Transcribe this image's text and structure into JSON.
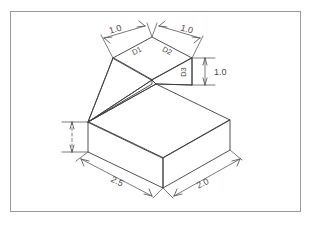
{
  "figure": {
    "frame": {
      "stroke_color": "#9a9a9a",
      "fill_color": "#ffffff",
      "x": 10,
      "y": 11,
      "width": 291,
      "height": 201
    },
    "style": {
      "object_line_color": "#3c3c3c",
      "dimension_line_color": "#5a5a5a",
      "text_color": "#4a4a4a",
      "background_color": "#ffffff"
    }
  },
  "dimensions": [
    {
      "id": "top-left-run",
      "label": "1.0",
      "orientation": "isometric-left",
      "description": "Top face left edge length"
    },
    {
      "id": "top-right-run",
      "label": "1.0",
      "orientation": "isometric-right",
      "description": "Top face right edge length"
    },
    {
      "id": "upper-height",
      "label": "1.0",
      "orientation": "vertical",
      "description": "Height of upper block right face"
    },
    {
      "id": "base-left-run",
      "label": "2.5",
      "orientation": "isometric-left",
      "description": "Base block left depth"
    },
    {
      "id": "base-right-run",
      "label": "2.0",
      "orientation": "isometric-right",
      "description": "Base block right width"
    },
    {
      "id": "base-height",
      "label": "",
      "orientation": "vertical",
      "description": "Base block height, unlabeled dimension"
    }
  ],
  "face_labels": [
    {
      "id": "face-d1",
      "label": "D1",
      "description": "Top face left half surface callout"
    },
    {
      "id": "face-d2",
      "label": "D2",
      "description": "Top face right half surface callout"
    },
    {
      "id": "face-d3",
      "label": "D3",
      "description": "Upper block right vertical face callout"
    }
  ]
}
